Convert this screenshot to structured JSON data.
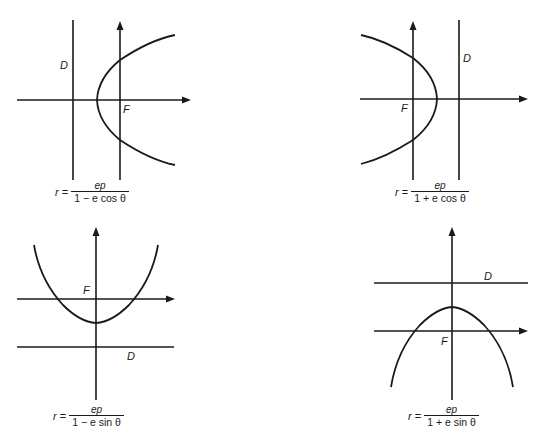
{
  "figure": {
    "panels": [
      {
        "id": "top-left",
        "directrix_label": "D",
        "focus_label": "F",
        "formula": {
          "lhs_var": "r",
          "equals": "=",
          "numerator": "ep",
          "denominator": "1 − e cos θ"
        },
        "opening": "right"
      },
      {
        "id": "top-right",
        "directrix_label": "D",
        "focus_label": "F",
        "formula": {
          "lhs_var": "r",
          "equals": "=",
          "numerator": "ep",
          "denominator": "1 + e cos θ"
        },
        "opening": "left"
      },
      {
        "id": "bottom-left",
        "directrix_label": "D",
        "focus_label": "F",
        "formula": {
          "lhs_var": "r",
          "equals": "=",
          "numerator": "ep",
          "denominator": "1 − e sin θ"
        },
        "opening": "up"
      },
      {
        "id": "bottom-right",
        "directrix_label": "D",
        "focus_label": "F",
        "formula": {
          "lhs_var": "r",
          "equals": "=",
          "numerator": "ep",
          "denominator": "1 + e sin θ"
        },
        "opening": "down"
      }
    ],
    "colors": {
      "ink": "#1a1a1a",
      "background": "#ffffff"
    }
  }
}
